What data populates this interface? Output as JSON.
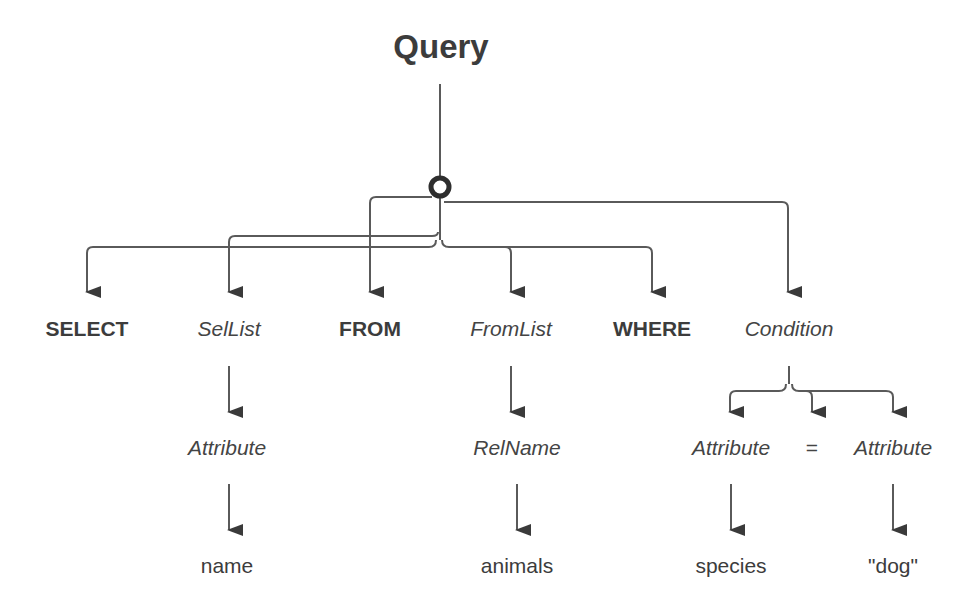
{
  "diagram": {
    "root": {
      "label": "Query",
      "style": "bold"
    },
    "hub": {
      "shape": "ring"
    },
    "children": [
      {
        "label": "SELECT",
        "style": "bold-keyword"
      },
      {
        "label": "SelList",
        "style": "italic-nonterminal",
        "child": {
          "label": "Attribute",
          "style": "italic-nonterminal",
          "child": {
            "label": "name",
            "style": "terminal"
          }
        }
      },
      {
        "label": "FROM",
        "style": "bold-keyword"
      },
      {
        "label": "FromList",
        "style": "italic-nonterminal",
        "child": {
          "label": "RelName",
          "style": "italic-nonterminal",
          "child": {
            "label": "animals",
            "style": "terminal"
          }
        }
      },
      {
        "label": "WHERE",
        "style": "bold-keyword"
      },
      {
        "label": "Condition",
        "style": "italic-nonterminal",
        "children": [
          {
            "label": "Attribute",
            "style": "italic-nonterminal",
            "child": {
              "label": "species",
              "style": "terminal"
            }
          },
          {
            "label": "=",
            "style": "operator"
          },
          {
            "label": "Attribute",
            "style": "italic-nonterminal",
            "child": {
              "label": "\"dog\"",
              "style": "terminal"
            }
          }
        ]
      }
    ]
  },
  "colors": {
    "line": "#5a5a5a",
    "text": "#3c3c3c",
    "background": "#ffffff"
  }
}
